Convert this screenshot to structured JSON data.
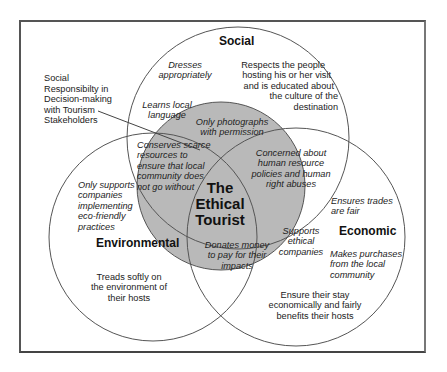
{
  "diagram": {
    "type": "venn",
    "center_label": [
      "The",
      "Ethical",
      "Tourist"
    ],
    "colors": {
      "center_fill": "#b9b9b9",
      "circle_stroke": "#555555",
      "frame_stroke": "#555555",
      "background": "#ffffff"
    },
    "circles": [
      {
        "name": "Social",
        "label": "Social"
      },
      {
        "name": "Environmental",
        "label": "Environmental"
      },
      {
        "name": "Economic",
        "label": "Economic"
      }
    ],
    "callout": {
      "lines": [
        "Social",
        "Responsibilty in",
        "Decision-making",
        "with Tourism",
        "Stakeholders"
      ]
    },
    "social": {
      "dresses": [
        "Dresses",
        "appropriately"
      ],
      "learns": [
        "Learns local",
        "language"
      ],
      "respects": [
        "Respects the people",
        "hosting his or her visit",
        "and is educated about",
        "the culture of the",
        "destination"
      ]
    },
    "social_center": {
      "photographs": [
        "Only photographs",
        "with permission"
      ]
    },
    "social_env_center": {
      "conserves": [
        "Conserves scarce",
        "resources to",
        "ensure that local",
        "community does",
        "not go without"
      ]
    },
    "social_econ_center": {
      "concerned": [
        "Concerned about",
        "human resource",
        "policies and human",
        "right abuses"
      ]
    },
    "environmental": {
      "supports": [
        "Only supports",
        "companies",
        "implementing",
        "eco-friendly",
        "practices"
      ],
      "treads": [
        "Treads softly on",
        "the environment of",
        "their hosts"
      ]
    },
    "env_econ_center": {
      "donates": [
        "Donates money",
        "to pay for their",
        "impacts"
      ]
    },
    "econ_center": {
      "supports_ethical": [
        "Supports",
        "ethical",
        "companies"
      ]
    },
    "economic": {
      "trades": [
        "Ensures trades",
        "are fair"
      ],
      "purchases": [
        "Makes purchases",
        "from the local",
        "community"
      ],
      "ensure_stay": [
        "Ensure their stay",
        "economically and fairly",
        "benefits their hosts"
      ]
    }
  }
}
